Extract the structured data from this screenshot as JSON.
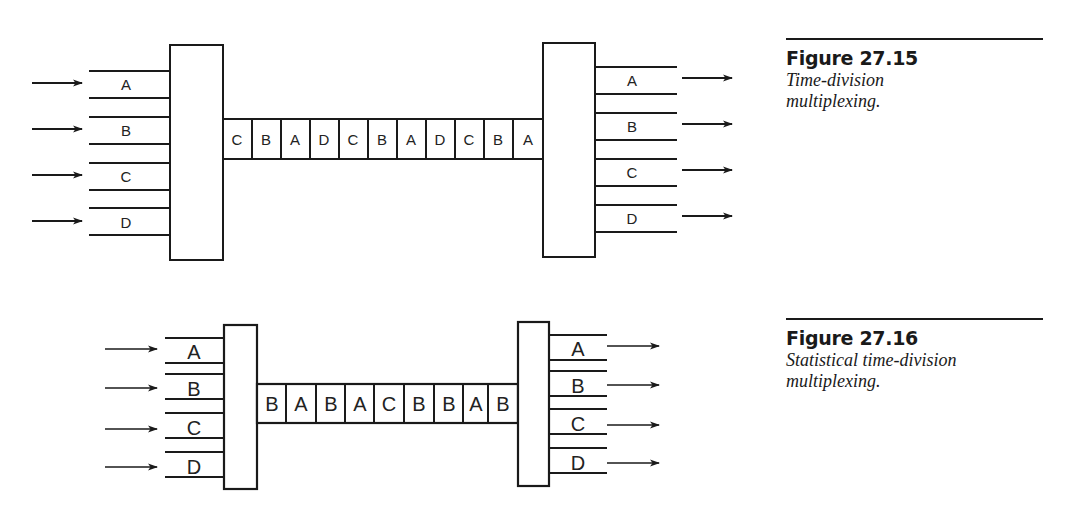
{
  "figures": [
    {
      "id": "27.15",
      "title": "Figure 27.15",
      "caption": "Time-division multiplexing.",
      "inputs": [
        "A",
        "B",
        "C",
        "D"
      ],
      "outputs": [
        "A",
        "B",
        "C",
        "D"
      ],
      "frame_slots": [
        "C",
        "B",
        "A",
        "D",
        "C",
        "B",
        "A",
        "D",
        "C",
        "B",
        "A"
      ]
    },
    {
      "id": "27.16",
      "title": "Figure 27.16",
      "caption": "Statistical time-division multiplexing.",
      "inputs": [
        "A",
        "B",
        "C",
        "D"
      ],
      "outputs": [
        "A",
        "B",
        "C",
        "D"
      ],
      "frame_slots": [
        "B",
        "A",
        "B",
        "A",
        "C",
        "B",
        "B",
        "A",
        "B"
      ]
    }
  ],
  "colors": {
    "ink": "#1a1a1a",
    "background": "#ffffff"
  }
}
